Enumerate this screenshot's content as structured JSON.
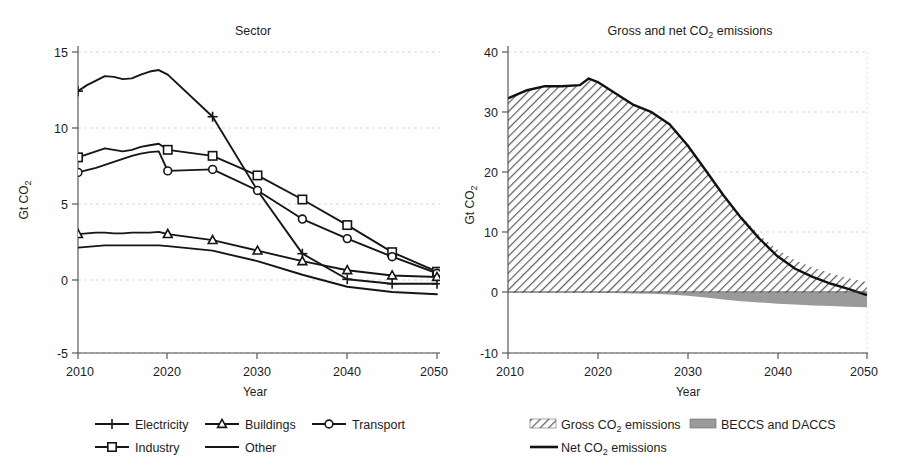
{
  "page": {
    "background": "#ffffff",
    "ink": "#161616",
    "grid_color": "#cfcfcf"
  },
  "chart_data": [
    {
      "id": "sector",
      "type": "line",
      "title": "Sector",
      "xlabel": "Year",
      "ylabel": "Gt CO₂",
      "ylabel_main": "Gt CO",
      "ylabel_sub": "2",
      "xlim": [
        2010,
        2050
      ],
      "ylim": [
        -5,
        15
      ],
      "xticks": [
        2010,
        2020,
        2030,
        2040,
        2050
      ],
      "yticks": [
        -5,
        0,
        5,
        10,
        15
      ],
      "grid": "horizontal-dashed",
      "legend_position": "bottom",
      "x": [
        2010,
        2011,
        2012,
        2013,
        2014,
        2015,
        2016,
        2017,
        2018,
        2019,
        2020,
        2025,
        2030,
        2035,
        2040,
        2045,
        2050
      ],
      "series": [
        {
          "name": "Electricity",
          "marker": "plus",
          "marker_years": [
            2010,
            2025,
            2035,
            2040,
            2045,
            2050
          ],
          "values": [
            12.4,
            12.8,
            13.1,
            13.4,
            13.35,
            13.2,
            13.25,
            13.5,
            13.7,
            13.8,
            13.5,
            10.7,
            5.8,
            1.6,
            -0.1,
            -0.4,
            -0.4
          ]
        },
        {
          "name": "Industry",
          "marker": "square",
          "marker_years": [
            2010,
            2020,
            2025,
            2030,
            2035,
            2040,
            2045,
            2050
          ],
          "values": [
            8.0,
            8.2,
            8.4,
            8.6,
            8.5,
            8.4,
            8.5,
            8.7,
            8.8,
            8.9,
            8.5,
            8.1,
            6.8,
            5.2,
            3.5,
            1.7,
            0.4
          ]
        },
        {
          "name": "Transport",
          "marker": "circle",
          "marker_years": [
            2010,
            2020,
            2025,
            2030,
            2035,
            2040,
            2045,
            2050
          ],
          "values": [
            7.0,
            7.15,
            7.3,
            7.5,
            7.7,
            7.9,
            8.1,
            8.25,
            8.35,
            8.4,
            7.1,
            7.2,
            5.8,
            3.9,
            2.6,
            1.4,
            0.3
          ]
        },
        {
          "name": "Buildings",
          "marker": "triangle",
          "marker_years": [
            2010,
            2020,
            2025,
            2030,
            2035,
            2040,
            2045,
            2050
          ],
          "values": [
            2.9,
            2.95,
            3.0,
            3.0,
            2.95,
            2.95,
            3.0,
            3.0,
            3.0,
            3.05,
            2.9,
            2.5,
            1.8,
            1.1,
            0.5,
            0.15,
            0.05
          ]
        },
        {
          "name": "Other",
          "marker": "none",
          "marker_years": [],
          "values": [
            2.0,
            2.05,
            2.1,
            2.15,
            2.15,
            2.15,
            2.15,
            2.15,
            2.15,
            2.15,
            2.1,
            1.8,
            1.1,
            0.2,
            -0.6,
            -0.95,
            -1.1
          ]
        }
      ],
      "legend": [
        {
          "label": "Electricity",
          "marker": "plus"
        },
        {
          "label": "Buildings",
          "marker": "triangle"
        },
        {
          "label": "Transport",
          "marker": "circle"
        },
        {
          "label": "Industry",
          "marker": "square"
        },
        {
          "label": "Other",
          "marker": "none"
        }
      ]
    },
    {
      "id": "gross-net",
      "type": "area",
      "title": "Gross and net CO₂ emissions",
      "title_parts": {
        "pre": "Gross and net CO",
        "sub": "2",
        "post": " emissions"
      },
      "xlabel": "Year",
      "ylabel": "Gt CO₂",
      "ylabel_main": "Gt CO",
      "ylabel_sub": "2",
      "xlim": [
        2010,
        2050
      ],
      "ylim": [
        -10,
        40
      ],
      "xticks": [
        2010,
        2020,
        2030,
        2040,
        2050
      ],
      "yticks": [
        -10,
        0,
        10,
        20,
        30,
        40
      ],
      "grid": "horizontal-dashed",
      "legend_position": "bottom",
      "x": [
        2010,
        2012,
        2014,
        2016,
        2018,
        2019,
        2020,
        2022,
        2024,
        2026,
        2028,
        2030,
        2032,
        2034,
        2036,
        2038,
        2040,
        2042,
        2044,
        2046,
        2048,
        2050
      ],
      "series": [
        {
          "name": "Gross CO₂ emissions",
          "fill": "hatch",
          "values": [
            32.3,
            33.6,
            34.3,
            34.3,
            34.5,
            35.6,
            35.0,
            33.1,
            31.2,
            30.0,
            28.0,
            24.5,
            20.5,
            16.4,
            12.8,
            9.6,
            7.2,
            5.4,
            4.2,
            3.2,
            2.4,
            1.8
          ]
        },
        {
          "name": "BECCS and DACCS",
          "fill": "solid-gray",
          "values": [
            0.0,
            0.0,
            0.0,
            0.0,
            0.0,
            0.0,
            0.0,
            -0.05,
            -0.1,
            -0.15,
            -0.3,
            -0.5,
            -0.8,
            -1.1,
            -1.4,
            -1.6,
            -1.8,
            -1.95,
            -2.1,
            -2.2,
            -2.3,
            -2.4
          ]
        },
        {
          "name": "Net CO₂ emissions",
          "fill": "none",
          "values": [
            32.3,
            33.6,
            34.3,
            34.3,
            34.5,
            35.6,
            35.0,
            33.1,
            31.2,
            30.0,
            28.0,
            24.5,
            20.4,
            16.2,
            12.4,
            9.0,
            6.1,
            4.0,
            2.6,
            1.5,
            0.6,
            -0.4
          ]
        }
      ],
      "legend": [
        {
          "label": "Gross CO₂ emissions",
          "label_parts": {
            "pre": "Gross CO",
            "sub": "2",
            "post": " emissions"
          },
          "swatch": "hatch"
        },
        {
          "label": "BECCS and DACCS",
          "label_parts": {
            "pre": "BECCS and DACCS",
            "sub": "",
            "post": ""
          },
          "swatch": "solid-gray"
        },
        {
          "label": "Net CO₂ emissions",
          "label_parts": {
            "pre": "Net CO",
            "sub": "2",
            "post": " emissions"
          },
          "swatch": "line"
        }
      ]
    }
  ]
}
